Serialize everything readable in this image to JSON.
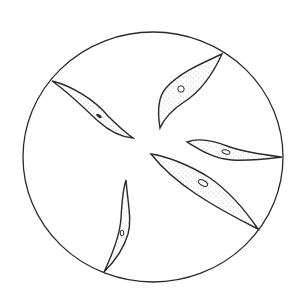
{
  "figure": {
    "description": "Microscope field of view showing five spindle-shaped (fusiform) cells radiating from the center, each with stippled cytoplasm and a small nucleus",
    "colors": {
      "background": "#ffffff",
      "outline": "#2a2a2a",
      "stipple": "#7a7a7a"
    },
    "field": {
      "cx": 153,
      "cy": 157,
      "rx": 130,
      "ry": 125
    },
    "cells": [
      {
        "id": "upper-left",
        "nucleus": "elongated-dark"
      },
      {
        "id": "upper-right",
        "nucleus": "round-open"
      },
      {
        "id": "right",
        "nucleus": "oval-open"
      },
      {
        "id": "lower-right",
        "nucleus": "oval-open-large"
      },
      {
        "id": "lower-left",
        "nucleus": "oval-small"
      }
    ]
  }
}
